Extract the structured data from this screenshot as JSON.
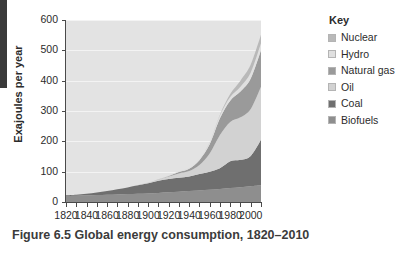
{
  "caption": "Figure 6.5 Global energy consumption, 1820–2010",
  "legend": {
    "title": "Key",
    "items": [
      {
        "label": "Nuclear",
        "color": "#b9b9b9"
      },
      {
        "label": "Hydro",
        "color": "#e0e0e0"
      },
      {
        "label": "Natural gas",
        "color": "#9a9a9a"
      },
      {
        "label": "Oil",
        "color": "#d2d2d2"
      },
      {
        "label": "Coal",
        "color": "#6f6f6f"
      },
      {
        "label": "Biofuels",
        "color": "#8e8e8e"
      }
    ]
  },
  "chart_data": {
    "type": "area",
    "stacked": true,
    "title": "Figure 6.5 Global energy consumption, 1820–2010",
    "xlabel": "",
    "ylabel": "Exajoules per year",
    "xlim": [
      1820,
      2010
    ],
    "ylim": [
      0,
      600
    ],
    "ytick_values": [
      0,
      100,
      200,
      300,
      400,
      500,
      600
    ],
    "ytick_labels": [
      "0",
      "100",
      "200",
      "300",
      "400",
      "500",
      "600"
    ],
    "xtick_values": [
      1820,
      1830,
      1840,
      1850,
      1860,
      1870,
      1880,
      1890,
      1900,
      1910,
      1920,
      1930,
      1940,
      1950,
      1960,
      1970,
      1980,
      1990,
      2000,
      2010
    ],
    "xtick_labels_shown": [
      "1820",
      "1840",
      "1860",
      "1880",
      "1900",
      "1920",
      "1940",
      "1960",
      "1980",
      "2000"
    ],
    "grid": true,
    "grid_color": "#f3f3f3",
    "plot_background": "#e3e3e3",
    "legend_position": "right",
    "x": [
      1820,
      1830,
      1840,
      1850,
      1860,
      1870,
      1880,
      1890,
      1900,
      1910,
      1920,
      1930,
      1940,
      1950,
      1960,
      1970,
      1980,
      1990,
      2000,
      2010
    ],
    "series": [
      {
        "name": "Biofuels",
        "color": "#8e8e8e",
        "values": [
          20,
          21,
          22,
          23,
          24,
          25,
          26,
          27,
          28,
          30,
          32,
          34,
          36,
          38,
          40,
          43,
          46,
          49,
          52,
          55
        ]
      },
      {
        "name": "Coal",
        "color": "#6f6f6f",
        "values": [
          2,
          3,
          5,
          8,
          12,
          17,
          22,
          28,
          34,
          40,
          44,
          46,
          48,
          54,
          60,
          68,
          88,
          90,
          100,
          150
        ]
      },
      {
        "name": "Oil",
        "color": "#d2d2d2",
        "values": [
          0,
          0,
          0,
          0,
          0,
          0,
          0,
          1,
          2,
          4,
          8,
          14,
          18,
          30,
          60,
          110,
          130,
          140,
          155,
          175
        ]
      },
      {
        "name": "Natural gas",
        "color": "#9a9a9a",
        "values": [
          0,
          0,
          0,
          0,
          0,
          0,
          0,
          0,
          0,
          1,
          2,
          5,
          8,
          16,
          30,
          55,
          70,
          85,
          100,
          120
        ]
      },
      {
        "name": "Hydro",
        "color": "#e0e0e0",
        "values": [
          0,
          0,
          0,
          0,
          0,
          0,
          0,
          0,
          0,
          1,
          1,
          2,
          3,
          4,
          6,
          9,
          12,
          16,
          20,
          23
        ]
      },
      {
        "name": "Nuclear",
        "color": "#b9b9b9",
        "values": [
          0,
          0,
          0,
          0,
          0,
          0,
          0,
          0,
          0,
          0,
          0,
          0,
          0,
          0,
          1,
          3,
          10,
          20,
          26,
          28
        ]
      }
    ]
  }
}
